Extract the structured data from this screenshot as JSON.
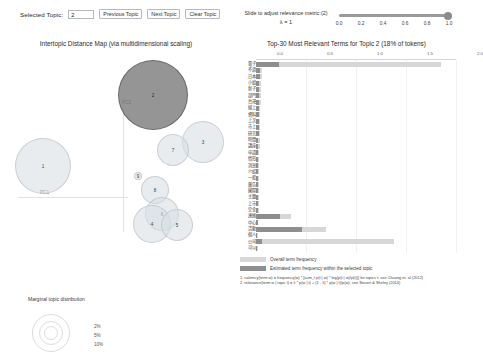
{
  "toolbar": {
    "selected_topic_label": "Selected Topic:",
    "selected_topic_value": "2",
    "previous_topic_label": "Previous Topic",
    "next_topic_label": "Next Topic",
    "clear_topic_label": "Clear Topic"
  },
  "slider": {
    "caption": "Slide to adjust relevance metric:(2)",
    "lambda_label": "λ = 1",
    "value": 1.0,
    "ticks": [
      "0.0",
      "0.2",
      "0.4",
      "0.6",
      "0.8",
      "1.0"
    ]
  },
  "left_panel": {
    "title": "Intertopic Distance Map (via multidimensional scaling)",
    "axis_x_label": "PC1",
    "axis_y_label": "PC2",
    "legend_title": "Marginal topic distribution",
    "legend_ticks": [
      "2%",
      "5%",
      "10%"
    ]
  },
  "right_panel": {
    "title": "Top-30 Most Relevant Terms for Topic 2 (18% of tokens)",
    "legend_overall": "Overall term frequency",
    "legend_topic": "Estimated term frequency within the selected topic",
    "footnote_1": "1. saliency(term w) = frequency(w) * [sum_t p(t | w) * log(p(t | w)/p(t))] for topics t; see Chuang et. al (2012)",
    "footnote_2": "2. relevance(term w | topic t) = λ * p(w | t) + (1 - λ) * p(w | t)/p(w); see Sievert & Shirley (2014)"
  },
  "chart_data": [
    {
      "type": "scatter",
      "title": "Intertopic Distance Map (via multidimensional scaling)",
      "xlabel": "PC1",
      "ylabel": "PC2",
      "selected_topic": 2,
      "topics": [
        {
          "id": 2,
          "x": 153,
          "y": 95,
          "r": 35,
          "selected": true
        },
        {
          "id": 1,
          "x": 43,
          "y": 166,
          "r": 28,
          "selected": false
        },
        {
          "id": 3,
          "x": 203,
          "y": 142,
          "r": 21,
          "selected": false
        },
        {
          "id": 7,
          "x": 173,
          "y": 150,
          "r": 16,
          "selected": false
        },
        {
          "id": 8,
          "x": 155,
          "y": 190,
          "r": 14,
          "selected": false
        },
        {
          "id": 6,
          "x": 162,
          "y": 214,
          "r": 17,
          "selected": false
        },
        {
          "id": 4,
          "x": 152,
          "y": 224,
          "r": 19,
          "selected": false
        },
        {
          "id": 5,
          "x": 177,
          "y": 225,
          "r": 16,
          "selected": false
        },
        {
          "id": 9,
          "x": 138,
          "y": 176,
          "r": 4,
          "selected": false
        }
      ]
    },
    {
      "type": "bar",
      "title": "Top-30 Most Relevant Terms for Topic 2 (18% of tokens)",
      "orientation": "horizontal",
      "xlim": [
        0,
        1.0
      ],
      "xticks": [
        "0.0",
        "0.5",
        "1.0",
        "1.5",
        "2.0"
      ],
      "xtick_fractions": [
        0.0,
        0.25,
        0.5,
        0.75,
        1.0
      ],
      "legend_position": "bottom-left",
      "grid": true,
      "series": [
        {
          "name": "Overall term frequency",
          "color": "#d7d7d7"
        },
        {
          "name": "Estimated term frequency within the selected topic",
          "color": "#8e8e8e"
        }
      ],
      "categories": [
        "電子",
        "不過",
        "日本",
        "小姐",
        "新子",
        "部門",
        "台灣",
        "線上",
        "資料",
        "上次",
        "市上",
        "研究",
        "時間",
        "講座",
        "申請",
        "情形",
        "消息",
        "介紹",
        "一般",
        "廣告",
        "國際",
        "主題",
        "上市",
        "完全",
        "連絡",
        "中心",
        "活動",
        "個人",
        "公司",
        "可以"
      ],
      "overall_values": [
        0.925,
        0.03,
        0.028,
        0.026,
        0.025,
        0.024,
        0.023,
        0.022,
        0.021,
        0.02,
        0.02,
        0.019,
        0.018,
        0.018,
        0.017,
        0.017,
        0.016,
        0.016,
        0.015,
        0.015,
        0.014,
        0.014,
        0.013,
        0.013,
        0.175,
        0.012,
        0.35,
        0.011,
        0.69,
        0.01
      ],
      "topic_values": [
        0.115,
        0.02,
        0.019,
        0.017,
        0.017,
        0.016,
        0.016,
        0.015,
        0.014,
        0.014,
        0.013,
        0.013,
        0.012,
        0.012,
        0.011,
        0.011,
        0.011,
        0.01,
        0.01,
        0.01,
        0.009,
        0.009,
        0.009,
        0.008,
        0.12,
        0.008,
        0.23,
        0.007,
        0.03,
        0.006
      ]
    }
  ]
}
